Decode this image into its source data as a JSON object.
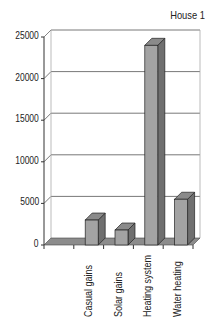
{
  "chart_data": {
    "type": "bar",
    "style": "3d-column",
    "title": "House 1",
    "categories": [
      "",
      "Casual gains",
      "Solar gains",
      "Heating system",
      "Water heating"
    ],
    "values": [
      0,
      3000,
      1800,
      24000,
      5500
    ],
    "xlabel": "",
    "ylabel": "",
    "ylim": [
      0,
      25000
    ],
    "yticks": [
      "0",
      "5000",
      "10000",
      "15000",
      "20000",
      "25000"
    ],
    "grid": true,
    "legend": null,
    "colors": {
      "bar_front": "#a3a3a3",
      "bar_side": "#6f6f6f",
      "bar_top": "#8a8a8a",
      "floor": "#8c8c8c",
      "grid": "#555555"
    }
  }
}
